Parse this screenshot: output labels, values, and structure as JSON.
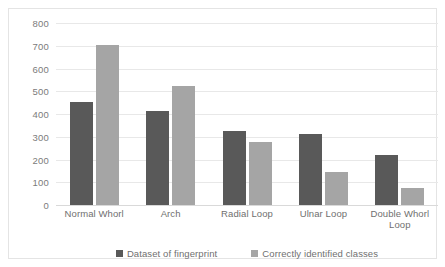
{
  "chart_data": {
    "type": "bar",
    "title": "",
    "subtitle": "",
    "xlabel": "",
    "ylabel": "",
    "ylim": [
      0,
      800
    ],
    "ytick_step": 100,
    "yticks": [
      "800",
      "700",
      "600",
      "500",
      "400",
      "300",
      "200",
      "100",
      "0"
    ],
    "grid": true,
    "legend_position": "bottom",
    "categories": [
      "Normal Whorl",
      "Arch",
      "Radial Loop",
      "Ulnar Loop",
      "Double Whorl Loop"
    ],
    "series": [
      {
        "name": "Dataset of fingerprint",
        "color": "#595959",
        "values": [
          455,
          415,
          325,
          310,
          220
        ]
      },
      {
        "name": "Correctly identified classes",
        "color": "#a5a5a5",
        "values": [
          705,
          525,
          275,
          145,
          75
        ]
      }
    ]
  },
  "colors": {
    "series_dark": "#595959",
    "series_light": "#a5a5a5",
    "gridline": "#e8e8e8",
    "frame_border": "#e4e4e4",
    "axis_text": "#7b7b7b",
    "background": "#ffffff"
  }
}
